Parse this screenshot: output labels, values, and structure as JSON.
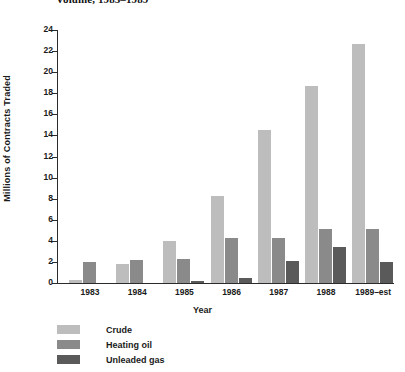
{
  "chart_data": {
    "type": "bar",
    "title": "Volume, 1983–1989",
    "xlabel": "Year",
    "ylabel": "Millions of Contracts Traded",
    "ylim": [
      0,
      24
    ],
    "ytick_step": 2,
    "yticks": [
      0,
      2,
      4,
      6,
      8,
      10,
      12,
      14,
      16,
      18,
      20,
      22,
      24
    ],
    "grid": false,
    "legend_position": "bottom-left",
    "categories": [
      "1983",
      "1984",
      "1985",
      "1986",
      "1987",
      "1988",
      "1989–est"
    ],
    "series": [
      {
        "name": "Crude",
        "color": "#bdbdbd",
        "values": [
          0.3,
          1.85,
          4.0,
          8.3,
          14.5,
          18.7,
          22.7
        ]
      },
      {
        "name": "Heating oil",
        "color": "#8a8a8a",
        "values": [
          2.0,
          2.15,
          2.3,
          4.3,
          4.3,
          5.1,
          5.1
        ]
      },
      {
        "name": "Unleaded gas",
        "color": "#5a5a5a",
        "values": [
          0,
          0,
          0.15,
          0.5,
          2.1,
          3.4,
          2.0
        ]
      }
    ]
  }
}
